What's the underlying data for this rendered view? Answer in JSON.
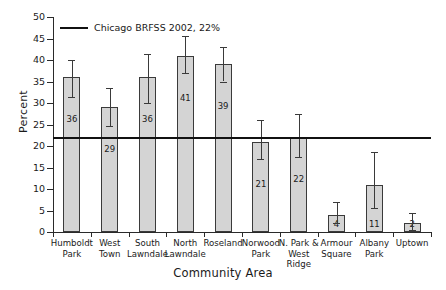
{
  "chart_data": {
    "type": "bar",
    "title": "",
    "xlabel": "Community Area",
    "ylabel": "Percent",
    "ylim": [
      0,
      50
    ],
    "ytick_step": 5,
    "yticks": [
      0,
      5,
      10,
      15,
      20,
      25,
      30,
      35,
      40,
      45,
      50
    ],
    "grid": false,
    "legend_position": "top-left",
    "categories": [
      "Humboldt Park",
      "West Town",
      "South Lawndale",
      "North Lawndale",
      "Roseland",
      "Norwood Park",
      "N. Park & West Ridge",
      "Armour Square",
      "Albany Park",
      "Uptown"
    ],
    "category_lines": [
      [
        "Humboldt",
        "Park"
      ],
      [
        "West",
        "Town"
      ],
      [
        "South",
        "Lawndale"
      ],
      [
        "North",
        "Lawndale"
      ],
      [
        "Roseland"
      ],
      [
        "Norwood",
        "Park"
      ],
      [
        "N. Park &",
        "West Ridge"
      ],
      [
        "Armour",
        "Square"
      ],
      [
        "Albany",
        "Park"
      ],
      [
        "Uptown"
      ]
    ],
    "values": [
      36,
      29,
      36,
      41,
      39,
      21,
      22,
      4,
      11,
      2
    ],
    "bar_labels": [
      "36",
      "29",
      "36",
      "41",
      "39",
      "21",
      "22",
      "4",
      "11",
      "2"
    ],
    "error_low": [
      31.4,
      24.6,
      30.0,
      37.0,
      35.0,
      17.0,
      17.5,
      2.0,
      5.5,
      0.5
    ],
    "error_high": [
      40.0,
      33.5,
      41.5,
      45.5,
      43.0,
      26.0,
      27.5,
      7.0,
      18.5,
      4.5
    ],
    "reference_line": {
      "label": "Chicago BRFSS 2002, 22%",
      "value": 22,
      "color": "#111111"
    },
    "bar_color": "#d4d4d4",
    "bar_edge_color": "#3a3a3a",
    "axis_color": "#2a2a2a"
  }
}
